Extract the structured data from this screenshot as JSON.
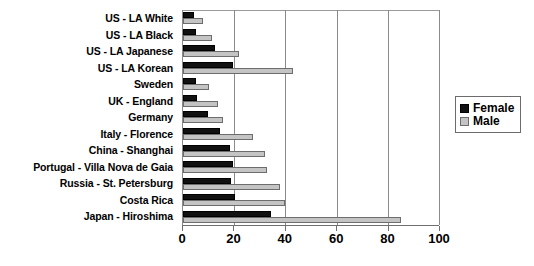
{
  "chart_data": {
    "type": "bar",
    "orientation": "horizontal",
    "title": "",
    "xlabel": "",
    "ylabel": "",
    "xlim": [
      0,
      100
    ],
    "xticks": [
      0,
      20,
      40,
      60,
      80,
      100
    ],
    "grid": true,
    "legend_position": "right",
    "categories": [
      "US - LA White",
      "US - LA Black",
      "US - LA Japanese",
      "US - LA Korean",
      "Sweden",
      "UK - England",
      "Germany",
      "Italy - Florence",
      "China - Shanghai",
      "Portugal - Villa Nova de Gaia",
      "Russia - St. Petersburg",
      "Costa Rica",
      "Japan - Hiroshima"
    ],
    "series": [
      {
        "name": "Female",
        "color": "#111111",
        "values": [
          4.3,
          5.0,
          12.5,
          19.6,
          5.0,
          5.5,
          9.7,
          14.5,
          18.5,
          19.6,
          18.7,
          20.4,
          34.5
        ]
      },
      {
        "name": "Male",
        "color": "#c4c4c4",
        "values": [
          8.0,
          11.4,
          22.0,
          43.0,
          10.0,
          13.5,
          15.5,
          27.5,
          32.0,
          33.0,
          38.0,
          39.7,
          85.0
        ]
      }
    ]
  },
  "legend": {
    "items": [
      {
        "label": "Female",
        "key": "female"
      },
      {
        "label": "Male",
        "key": "male"
      }
    ]
  }
}
